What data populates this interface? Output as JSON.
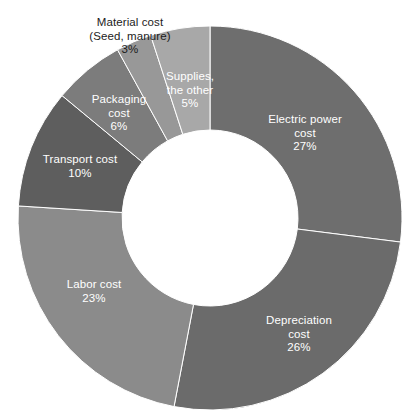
{
  "chart_data": {
    "type": "pie",
    "variant": "donut",
    "title": "",
    "subtitle": "",
    "xlabel": "",
    "ylabel": "",
    "legend": "none",
    "grid": false,
    "units": "percent",
    "total": 100,
    "start_angle_deg": 0,
    "direction": "clockwise",
    "categories": [
      "Electric power cost",
      "Depreciation cost",
      "Labor cost",
      "Transport cost",
      "Packaging cost",
      "Material cost (Seed, manure)",
      "Supplies, the other"
    ],
    "values": [
      27,
      26,
      23,
      10,
      6,
      3,
      5
    ],
    "slices": [
      {
        "name": "Electric power cost",
        "label": "Electric power\ncost\n27%",
        "value": 27,
        "value_text": "27%",
        "color": "#6e6e6e",
        "label_color": "#ffffff",
        "label_placement": "inside",
        "label_x": 305,
        "label_y": 133
      },
      {
        "name": "Depreciation cost",
        "label": "Depreciation\ncost\n26%",
        "value": 26,
        "value_text": "26%",
        "color": "#6b6b6b",
        "label_color": "#ffffff",
        "label_placement": "inside",
        "label_x": 299,
        "label_y": 334
      },
      {
        "name": "Labor cost",
        "label": "Labor cost\n23%",
        "value": 23,
        "value_text": "23%",
        "color": "#8b8b8b",
        "label_color": "#ffffff",
        "label_placement": "inside",
        "label_x": 94,
        "label_y": 292
      },
      {
        "name": "Transport cost",
        "label": "Transport cost\n10%",
        "value": 10,
        "value_text": "10%",
        "color": "#5e5e5e",
        "label_color": "#ffffff",
        "label_placement": "inside",
        "label_x": 80,
        "label_y": 167
      },
      {
        "name": "Packaging cost",
        "label": "Packaging\ncost\n6%",
        "value": 6,
        "value_text": "6%",
        "color": "#7c7c7c",
        "label_color": "#ffffff",
        "label_placement": "inside",
        "label_x": 119,
        "label_y": 113
      },
      {
        "name": "Material cost (Seed, manure)",
        "label": "Material cost\n(Seed, manure)\n3%",
        "value": 3,
        "value_text": "3%",
        "color": "#989898",
        "label_color": "#1c1c1c",
        "label_placement": "outside",
        "label_x": 130,
        "label_y": 36
      },
      {
        "name": "Supplies, the other",
        "label": "Supplies,\nthe other\n5%",
        "value": 5,
        "value_text": "5%",
        "color": "#a8a8a8",
        "label_color": "#ffffff",
        "label_placement": "inside",
        "label_x": 190,
        "label_y": 90
      }
    ],
    "geometry": {
      "center_x": 210,
      "center_y": 218,
      "outer_radius": 192,
      "inner_radius": 88,
      "hole_color": "#ffffff"
    },
    "background_color": "#ffffff"
  }
}
